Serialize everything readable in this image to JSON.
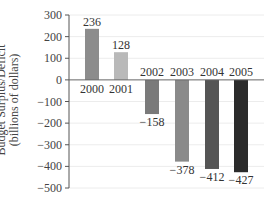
{
  "chart_data": {
    "type": "bar",
    "title": "",
    "xlabel": "",
    "ylabel": "Budget Surplus/Deficit",
    "ylabel_line2": "(billions of dollars)",
    "categories": [
      "2000",
      "2001",
      "2002",
      "2003",
      "2004",
      "2005"
    ],
    "values": [
      236,
      128,
      -158,
      -378,
      -412,
      -427
    ],
    "value_labels": [
      "236",
      "128",
      "−158",
      "−378",
      "−412",
      "−427"
    ],
    "bar_colors": [
      "#8c8c8c",
      "#b9b9b9",
      "#7a7a7a",
      "#8a8a8a",
      "#555555",
      "#2b2b2b"
    ],
    "ylim": [
      -500,
      300
    ],
    "yticks": [
      300,
      200,
      100,
      0,
      -100,
      -200,
      -300,
      -400,
      -500
    ],
    "ytick_labels": [
      "300",
      "200",
      "100",
      "0",
      "−100",
      "−200",
      "−300",
      "−400",
      "−500"
    ],
    "grid": true,
    "legend": null
  }
}
